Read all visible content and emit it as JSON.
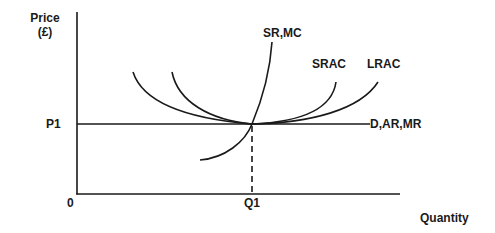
{
  "diagram": {
    "type": "economics-cost-revenue-diagram",
    "y_axis": {
      "label_line1": "Price",
      "label_line2": "(£)"
    },
    "x_axis": {
      "label": "Quantity"
    },
    "origin_label": "0",
    "price_level": {
      "label": "P1"
    },
    "quantity_level": {
      "label": "Q1"
    },
    "curves": {
      "srmc": {
        "label": "SR,MC"
      },
      "srac": {
        "label": "SRAC"
      },
      "lrac": {
        "label": "LRAC"
      },
      "demand": {
        "label": "D,AR,MR"
      }
    },
    "colors": {
      "line": "#1a1a1a",
      "background": "#ffffff"
    }
  }
}
